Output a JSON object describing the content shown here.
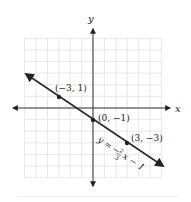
{
  "chart_data": {
    "type": "line",
    "title": "",
    "xlabel": "x",
    "ylabel": "y",
    "xlim": [
      -6,
      6
    ],
    "ylim": [
      -6,
      6
    ],
    "grid": true,
    "series": [
      {
        "name": "y = -2/3 x - 1",
        "equation": "y = -(2/3)x - 1",
        "slope": -0.6667,
        "intercept": -1,
        "x": [
          -6.5,
          6.5
        ],
        "y": [
          3.33,
          -5.33
        ]
      }
    ],
    "points": [
      {
        "x": -3,
        "y": 1,
        "label": "(−3, 1)"
      },
      {
        "x": 0,
        "y": -1,
        "label": "(0, −1)"
      },
      {
        "x": 3,
        "y": -3,
        "label": "(3, −3)"
      }
    ],
    "annotations": [
      {
        "text": "y = −2/3 x − 1",
        "position": "along line, lower right"
      }
    ]
  },
  "labels": {
    "x_axis": "x",
    "y_axis": "y",
    "p1": "(−3, 1)",
    "p2": "(0, −1)",
    "p3": "(3, −3)",
    "eq_y": "y =",
    "eq_minus": "−",
    "eq_num": "2",
    "eq_den": "3",
    "eq_rest": "x − 1"
  },
  "colors": {
    "grid": "#e2e2e2",
    "axis": "#333333",
    "line": "#2a2a2a"
  }
}
